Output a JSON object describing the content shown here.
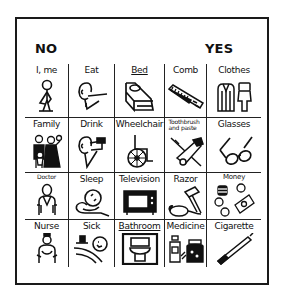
{
  "board": {
    "no_label": "NO",
    "yes_label": "YES",
    "rows": [
      [
        {
          "label": "I, me",
          "icon": "person-self-icon"
        },
        {
          "label": "Eat",
          "icon": "person-eating-icon"
        },
        {
          "label": "Bed",
          "icon": "bed-icon"
        },
        {
          "label": "Comb",
          "icon": "comb-icon"
        },
        {
          "label": "Clothes",
          "icon": "clothes-icon"
        }
      ],
      [
        {
          "label": "Family",
          "icon": "family-icon"
        },
        {
          "label": "Drink",
          "icon": "person-drinking-icon"
        },
        {
          "label": "Wheelchair",
          "icon": "wheelchair-icon"
        },
        {
          "label": "Toothbrush and paste",
          "icon": "toothbrush-icon"
        },
        {
          "label": "Glasses",
          "icon": "glasses-icon"
        }
      ],
      [
        {
          "label": "Doctor",
          "icon": "doctor-icon"
        },
        {
          "label": "Sleep",
          "icon": "sleep-icon"
        },
        {
          "label": "Television",
          "icon": "television-icon"
        },
        {
          "label": "Razor",
          "icon": "razor-icon"
        },
        {
          "label": "Money",
          "icon": "money-icon"
        }
      ],
      [
        {
          "label": "Nurse",
          "icon": "nurse-icon"
        },
        {
          "label": "Sick",
          "icon": "sick-in-bed-icon"
        },
        {
          "label": "Bathroom",
          "icon": "toilet-icon"
        },
        {
          "label": "Medicine",
          "icon": "medicine-icon"
        },
        {
          "label": "Cigarette",
          "icon": "cigarette-icon"
        }
      ]
    ]
  }
}
